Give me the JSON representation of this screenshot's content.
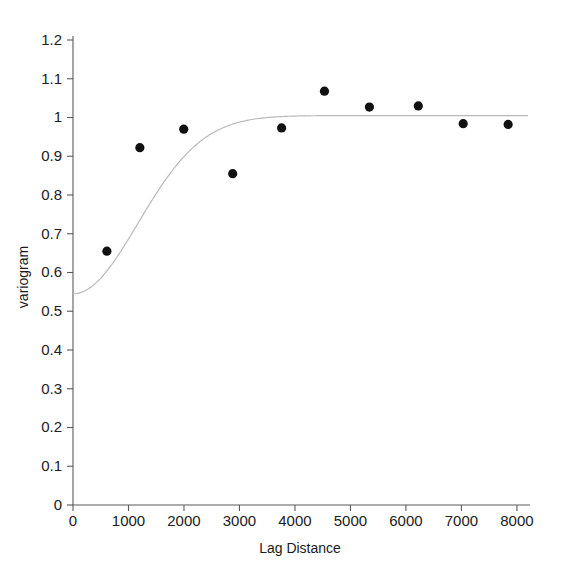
{
  "chart_data": {
    "type": "scatter",
    "title": "",
    "xlabel": "Lag Distance",
    "ylabel": "variogram",
    "xlim": [
      0,
      8200
    ],
    "ylim": [
      0,
      1.2
    ],
    "grid": false,
    "legend": null,
    "x_ticks": [
      0,
      1000,
      2000,
      3000,
      4000,
      5000,
      6000,
      7000,
      8000
    ],
    "x_tick_labels": [
      "0",
      "1000",
      "2000",
      "3000",
      "4000",
      "5000",
      "6000",
      "7000",
      "8000"
    ],
    "y_ticks": [
      0,
      0.1,
      0.2,
      0.3,
      0.4,
      0.5,
      0.6,
      0.7,
      0.8,
      0.9,
      1,
      1.1,
      1.2
    ],
    "y_tick_labels": [
      "0",
      "0.1",
      "0.2",
      "0.3",
      "0.4",
      "0.5",
      "0.6",
      "0.7",
      "0.8",
      "0.9",
      "1",
      "1.1",
      "1.2"
    ],
    "series": [
      {
        "name": "experimental variogram",
        "marker": "filled-circle",
        "color": "#111111",
        "x": [
          611,
          1205,
          1996,
          2878,
          3759,
          4532,
          5342,
          6223,
          7032,
          7842
        ],
        "y": [
          0.655,
          0.922,
          0.97,
          0.855,
          0.973,
          1.068,
          1.027,
          1.03,
          0.984,
          0.982
        ]
      },
      {
        "name": "fitted model",
        "marker": "line",
        "color": "#b9b9b9",
        "model": "gaussian",
        "nugget": 0.545,
        "sill": 1.005,
        "range": 1650
      }
    ]
  },
  "axes": {
    "x_title": "Lag Distance",
    "y_title": "variogram"
  }
}
